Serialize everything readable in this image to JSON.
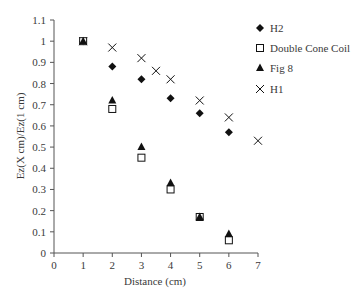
{
  "chart_data": {
    "type": "scatter",
    "title": "",
    "xlabel": "Distance (cm)",
    "ylabel": "Ez(X cm)/Ez(1 cm)",
    "xlim": [
      0,
      7
    ],
    "ylim": [
      0,
      1.1
    ],
    "xticks": [
      0,
      1,
      2,
      3,
      4,
      5,
      6,
      7
    ],
    "yticks": [
      0,
      0.1,
      0.2,
      0.3,
      0.4,
      0.5,
      0.6,
      0.7,
      0.8,
      0.9,
      1,
      1.1
    ],
    "ytick_labels": [
      "0",
      "0.1",
      "0.2",
      "0.3",
      "0.4",
      "0.5",
      "0.6",
      "0.7",
      "0.8",
      "0.9",
      "1",
      "1.1"
    ],
    "grid": false,
    "legend_position": "upper right, outside plot",
    "series": [
      {
        "name": "H2",
        "marker": "diamond-filled",
        "x": [
          1,
          2,
          3,
          4,
          5,
          6
        ],
        "values": [
          1.0,
          0.88,
          0.82,
          0.73,
          0.66,
          0.57
        ]
      },
      {
        "name": "Double Cone Coil",
        "marker": "square-open",
        "x": [
          1,
          2,
          3,
          4,
          5,
          6
        ],
        "values": [
          1.0,
          0.68,
          0.45,
          0.3,
          0.17,
          0.06
        ]
      },
      {
        "name": "Fig 8",
        "marker": "triangle-filled",
        "x": [
          1,
          2,
          3,
          4,
          5,
          6
        ],
        "values": [
          1.0,
          0.72,
          0.5,
          0.33,
          0.17,
          0.09
        ]
      },
      {
        "name": "H1",
        "marker": "x",
        "x": [
          1,
          2,
          3,
          3.5,
          4,
          5,
          6,
          7
        ],
        "values": [
          1.0,
          0.97,
          0.92,
          0.86,
          0.82,
          0.72,
          0.64,
          0.53
        ]
      }
    ]
  },
  "legend": {
    "items": [
      {
        "label": "H2",
        "marker": "diamond-filled"
      },
      {
        "label": "Double Cone Coil",
        "marker": "square-open"
      },
      {
        "label": "Fig 8",
        "marker": "triangle-filled"
      },
      {
        "label": "H1",
        "marker": "x"
      }
    ]
  },
  "colors": {
    "marker": "#111111",
    "axis": "#555555",
    "text": "#3a3a3a"
  }
}
